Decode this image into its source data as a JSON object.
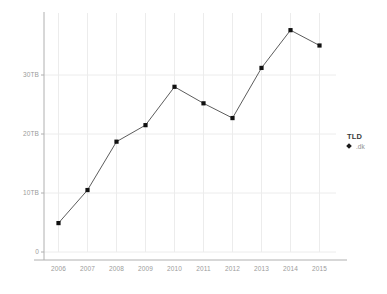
{
  "chart_data": {
    "type": "line",
    "title": "",
    "xlabel": "",
    "ylabel": "",
    "categories": [
      "2006",
      "2007",
      "2008",
      "2009",
      "2010",
      "2011",
      "2012",
      "2013",
      "2014",
      "2015"
    ],
    "x": [
      2006,
      2007,
      2008,
      2009,
      2010,
      2011,
      2012,
      2013,
      2014,
      2015
    ],
    "series": [
      {
        "name": ".dk",
        "values": [
          4.9,
          10.5,
          18.7,
          21.5,
          28.0,
          25.2,
          22.7,
          31.2,
          37.6,
          35.0
        ]
      }
    ],
    "ylim": [
      0,
      40
    ],
    "xlim": [
      2005.5,
      2015.5
    ],
    "ytick_labels": [
      "0",
      "10TB",
      "20TB",
      "30TB"
    ],
    "ytick_values": [
      0,
      10,
      20,
      30
    ],
    "xtick_labels": [
      "2006",
      "2007",
      "2008",
      "2009",
      "2010",
      "2011",
      "2012",
      "2013",
      "2014",
      "2015"
    ],
    "grid": true,
    "legend_position": "right",
    "legend_title": "TLD",
    "legend_entries": [
      ".dk"
    ],
    "marker": "square",
    "line_color": "#4a4a4a",
    "marker_color": "#111111",
    "grid_color": "#ececec",
    "axis_color": "#b0b0b0",
    "tick_text_color": "#9b9b9b"
  },
  "legend": {
    "title": "TLD",
    "entries": [
      {
        "label": ".dk",
        "marker": "diamond-marker"
      }
    ]
  },
  "axes": {
    "y_ticks": [
      {
        "label": "30TB",
        "value": 30
      },
      {
        "label": "20TB",
        "value": 20
      },
      {
        "label": "10TB",
        "value": 10
      },
      {
        "label": "0",
        "value": 0
      }
    ],
    "x_ticks": [
      {
        "label": "2006"
      },
      {
        "label": "2007"
      },
      {
        "label": "2008"
      },
      {
        "label": "2009"
      },
      {
        "label": "2010"
      },
      {
        "label": "2011"
      },
      {
        "label": "2012"
      },
      {
        "label": "2013"
      },
      {
        "label": "2014"
      },
      {
        "label": "2015"
      }
    ]
  }
}
